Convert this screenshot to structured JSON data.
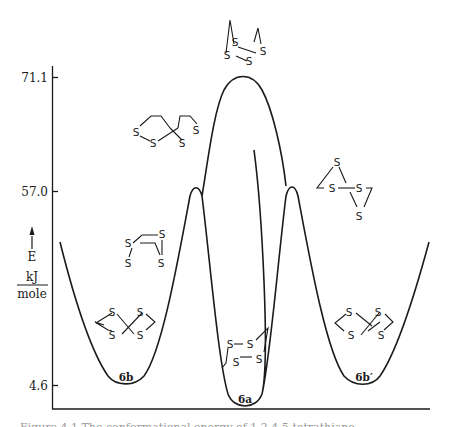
{
  "figure": {
    "type": "potential-energy-diagram",
    "y_axis": {
      "quantity_label": "E",
      "unit_numerator": "kJ",
      "unit_denominator": "mole",
      "ticks": [
        {
          "value": "71.1",
          "y": 77
        },
        {
          "value": "57.0",
          "y": 191
        },
        {
          "value": "4.6",
          "y": 385
        }
      ]
    },
    "minima": [
      {
        "id": "6b",
        "label": "6b",
        "energy": 4.6
      },
      {
        "id": "6a",
        "label": "6a",
        "energy": 0
      },
      {
        "id": "6b_prime",
        "label": "6b′",
        "energy": 4.6
      }
    ],
    "barriers": [
      {
        "id": "ts-left",
        "energy": 57.0
      },
      {
        "id": "ts-central",
        "energy": 71.1
      },
      {
        "id": "ts-right",
        "energy": 57.0
      }
    ],
    "atom_symbol": "S",
    "caption_partial": "Figure 4.1  The conformational energy of 1,2,4,5-tetrathiane..."
  },
  "colors": {
    "line": "#1a1a1a",
    "background": "#ffffff"
  }
}
